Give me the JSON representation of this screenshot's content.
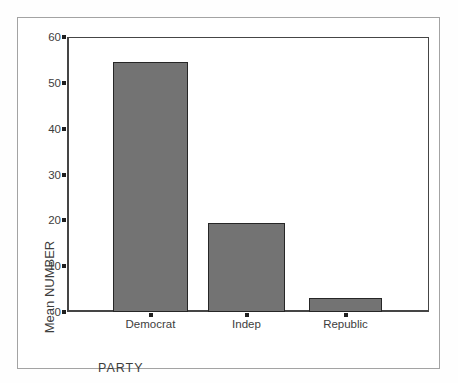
{
  "chart_data": {
    "type": "bar",
    "categories": [
      "Democrat",
      "Indep",
      "Republic"
    ],
    "values": [
      54.5,
      19.5,
      3
    ],
    "title": "",
    "xlabel": "PARTY",
    "ylabel": "Mean NUMBER",
    "ylim": [
      0,
      60
    ],
    "yticks": [
      0,
      10,
      20,
      30,
      40,
      50,
      60
    ],
    "grid": false,
    "legend": "none",
    "bar_fill_color": "#737373",
    "bar_border_color": "#262626",
    "axis_frame_color": "#454545",
    "outer_frame_color": "#a3a3a3",
    "text_color": "#3d3d3d"
  }
}
